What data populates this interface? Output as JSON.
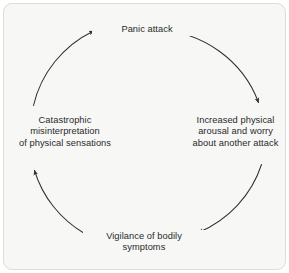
{
  "figure": {
    "type": "cycle-diagram",
    "direction": "clockwise",
    "background_color": "#f7f7f6",
    "border_color": "#dcdcdc",
    "stroke_color": "#333333",
    "text_color": "#2a2a2a",
    "nodes": [
      {
        "id": "panic-attack",
        "label": "Panic attack",
        "position": "top"
      },
      {
        "id": "increased-arousal",
        "label": "Increased physical\narousal and worry\nabout another attack",
        "position": "right"
      },
      {
        "id": "vigilance",
        "label": "Vigilance of bodily\nsymptoms",
        "position": "bottom"
      },
      {
        "id": "catastrophic-misinterpretation",
        "label": "Catastrophic\nmisinterpretation\nof physical sensations",
        "position": "left"
      }
    ],
    "arrows": [
      {
        "id": "panic-to-arousal",
        "from": "panic-attack",
        "to": "increased-arousal"
      },
      {
        "id": "arousal-to-vigilance",
        "from": "increased-arousal",
        "to": "vigilance"
      },
      {
        "id": "vigilance-to-catastrophic",
        "from": "vigilance",
        "to": "catastrophic-misinterpretation"
      },
      {
        "id": "catastrophic-to-panic",
        "from": "catastrophic-misinterpretation",
        "to": "panic-attack"
      }
    ]
  }
}
